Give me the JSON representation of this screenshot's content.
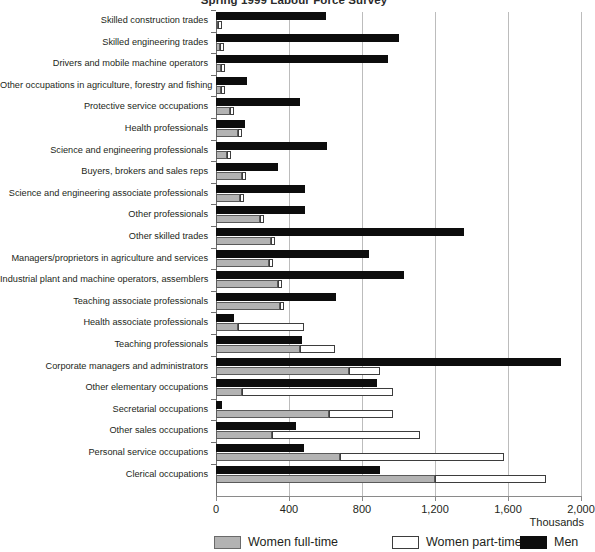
{
  "title": "Spring 1999 Labour Force Survey",
  "axis": {
    "unit_label": "Thousands",
    "ticks": [
      "0",
      "400",
      "800",
      "1,200",
      "1,600",
      "2,000"
    ],
    "tick_values": [
      0,
      400,
      800,
      1200,
      1600,
      2000
    ],
    "xmin": 0,
    "xmax": 2000
  },
  "legend": [
    {
      "label": "Women full-time",
      "key": "women_full_time",
      "color": "#b3b3b3"
    },
    {
      "label": "Women part-time",
      "key": "women_part_time",
      "color": "#ffffff"
    },
    {
      "label": "Men",
      "key": "men",
      "color": "#0d0d0d"
    }
  ],
  "chart_data": {
    "type": "bar",
    "orientation": "horizontal",
    "title": "Spring 1999 Labour Force Survey",
    "xlabel": "Thousands",
    "ylabel": "",
    "xlim": [
      0,
      2000
    ],
    "grid": true,
    "legend_position": "bottom",
    "categories": [
      "Skilled construction trades",
      "Skilled engineering trades",
      "Drivers and mobile machine operators",
      "Other occupations in agriculture, forestry and fishing",
      "Protective service occupations",
      "Health professionals",
      "Science and engineering professionals",
      "Buyers, brokers and sales reps",
      "Science and engineering associate professionals",
      "Other professionals",
      "Other skilled trades",
      "Managers/proprietors in agriculture and services",
      "Industrial plant and machine operators, assemblers",
      "Teaching associate professionals",
      "Health associate professionals",
      "Teaching professionals",
      "Corporate managers and administrators",
      "Other elementary occupations",
      "Secretarial occupations",
      "Other sales occupations",
      "Personal service occupations",
      "Clerical occupations"
    ],
    "series": [
      {
        "name": "Men",
        "color": "#0d0d0d",
        "values": [
          600,
          1000,
          940,
          170,
          460,
          160,
          610,
          340,
          490,
          490,
          1360,
          840,
          1030,
          660,
          100,
          470,
          1890,
          880,
          35,
          440,
          480,
          900
        ]
      },
      {
        "name": "Women full-time",
        "color": "#b3b3b3",
        "values": [
          10,
          20,
          25,
          30,
          75,
          120,
          60,
          140,
          130,
          240,
          300,
          290,
          340,
          350,
          120,
          460,
          730,
          140,
          620,
          305,
          680,
          1200
        ]
      },
      {
        "name": "Women part-time",
        "color": "#ffffff",
        "values": [
          5,
          10,
          20,
          35,
          35,
          60,
          20,
          85,
          55,
          65,
          60,
          150,
          120,
          130,
          480,
          650,
          900,
          970,
          970,
          1120,
          1580,
          1810
        ]
      }
    ]
  }
}
